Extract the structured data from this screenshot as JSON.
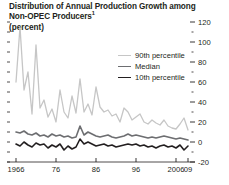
{
  "title": {
    "line1": "Distribution of Annual Production Growth among",
    "line2": "Non-OPEC Producers",
    "footnote_marker": "1",
    "units": "(percent)"
  },
  "legend": [
    {
      "label": "90th percentile",
      "color": "#c6c6c6",
      "width": 1.3
    },
    {
      "label": "Median",
      "color": "#6d6e71",
      "width": 1.6
    },
    {
      "label": "10th percentile",
      "color": "#231f20",
      "width": 1.6
    }
  ],
  "axis": {
    "y_ticks": [
      "120",
      "100",
      "80",
      "60",
      "40",
      "20",
      "0",
      "-20"
    ],
    "y_tick_values": [
      120,
      100,
      80,
      60,
      40,
      20,
      0,
      -20
    ],
    "y_minor_values": [
      110,
      90,
      70,
      50,
      30,
      10,
      -10
    ],
    "x_ticks": [
      {
        "label": "1966",
        "year": 1966
      },
      {
        "label": "76",
        "year": 1976
      },
      {
        "label": "86",
        "year": 1986
      },
      {
        "label": "96",
        "year": 1996
      },
      {
        "label": "2006",
        "year": 2006
      },
      {
        "label": "09",
        "year": 2009
      }
    ],
    "y_axis_side": "right",
    "grid": false
  },
  "chart_data": {
    "type": "line",
    "title": "Distribution of Annual Production Growth among Non-OPEC Producers",
    "xlabel": "",
    "ylabel": "(percent)",
    "xlim": [
      1966,
      2009
    ],
    "ylim": [
      -20,
      125
    ],
    "grid": false,
    "legend_position": "inside-top-right",
    "x": [
      1966,
      1967,
      1968,
      1969,
      1970,
      1971,
      1972,
      1973,
      1974,
      1975,
      1976,
      1977,
      1978,
      1979,
      1980,
      1981,
      1982,
      1983,
      1984,
      1985,
      1986,
      1987,
      1988,
      1989,
      1990,
      1991,
      1992,
      1993,
      1994,
      1995,
      1996,
      1997,
      1998,
      1999,
      2000,
      2001,
      2002,
      2003,
      2004,
      2005,
      2006,
      2007,
      2008,
      2009
    ],
    "series": [
      {
        "name": "90th percentile",
        "color": "#c6c6c6",
        "values": [
          60,
          115,
          52,
          70,
          28,
          97,
          34,
          42,
          25,
          33,
          20,
          52,
          30,
          24,
          46,
          29,
          63,
          30,
          38,
          27,
          55,
          35,
          30,
          32,
          26,
          28,
          20,
          34,
          30,
          22,
          25,
          28,
          20,
          18,
          22,
          19,
          17,
          22,
          16,
          14,
          13,
          18,
          24,
          12
        ]
      },
      {
        "name": "Median",
        "color": "#6d6e71",
        "values": [
          10,
          9,
          11,
          8,
          7,
          9,
          6,
          7,
          5,
          8,
          6,
          7,
          5,
          6,
          4,
          5,
          16,
          7,
          10,
          8,
          6,
          5,
          6,
          7,
          5,
          4,
          5,
          6,
          8,
          6,
          7,
          6,
          5,
          4,
          5,
          4,
          5,
          6,
          5,
          4,
          3,
          4,
          3,
          2
        ]
      },
      {
        "name": "10th percentile",
        "color": "#231f20",
        "values": [
          -2,
          -4,
          0,
          -3,
          -5,
          -1,
          -3,
          -2,
          -6,
          -3,
          -5,
          -2,
          -8,
          -4,
          -7,
          -5,
          3,
          -2,
          0,
          -2,
          -4,
          -3,
          -2,
          -4,
          -3,
          -5,
          -4,
          -3,
          -2,
          -3,
          -2,
          -4,
          -3,
          -5,
          -4,
          -6,
          -4,
          -3,
          -5,
          -4,
          -6,
          -3,
          -8,
          -4
        ]
      }
    ]
  }
}
